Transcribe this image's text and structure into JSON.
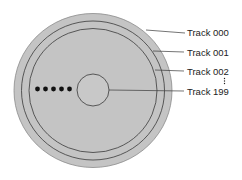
{
  "diagram": {
    "colors": {
      "disk": "#c4c4c4",
      "line": "#3a3a3a",
      "text": "#222222"
    },
    "labels": [
      {
        "id": "track-000",
        "text": "Track 000"
      },
      {
        "id": "track-001",
        "text": "Track 001"
      },
      {
        "id": "track-002",
        "text": "Track 002"
      },
      {
        "id": "track-199",
        "text": "Track 199"
      }
    ],
    "ellipsis_dots": 5
  }
}
